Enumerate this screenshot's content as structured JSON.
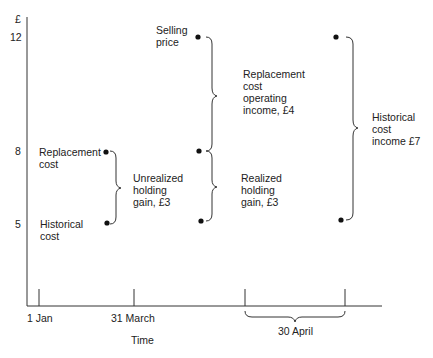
{
  "figure": {
    "y_axis": {
      "unit_label": "£",
      "ticks": [
        {
          "label": "12",
          "value": 12
        },
        {
          "label": "8",
          "value": 8
        },
        {
          "label": "5",
          "value": 5
        }
      ]
    },
    "x_axis": {
      "title": "Time",
      "ticks": [
        {
          "label": "1 Jan"
        },
        {
          "label": "31 March"
        },
        {
          "label": "30 April"
        }
      ]
    },
    "points": [
      {
        "label": "Replacement\ncost",
        "value": 8,
        "time": "31 March"
      },
      {
        "label": "Historical\ncost",
        "value": 5,
        "time": "31 March"
      },
      {
        "label": "Selling\nprice",
        "value": 12,
        "time": "30 April"
      }
    ],
    "annotations": [
      {
        "name": "unrealized-holding-gain",
        "text": "Unrealized\nholding\ngain, £3"
      },
      {
        "name": "replacement-cost-operating-income",
        "text": "Replacement\ncost\noperating\nincome, £4"
      },
      {
        "name": "realized-holding-gain",
        "text": "Realized\nholding\ngain, £3"
      },
      {
        "name": "historical-cost-income",
        "text": "Historical\ncost\nincome £7"
      }
    ]
  }
}
